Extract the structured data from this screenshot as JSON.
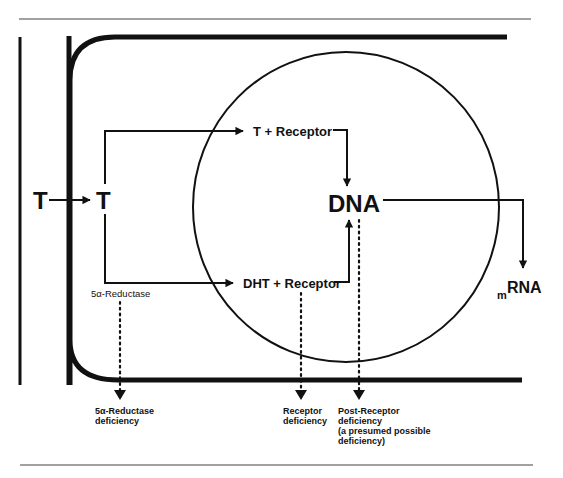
{
  "diagram": {
    "colors": {
      "ink": "#111111",
      "rule": "#444444",
      "background": "#ffffff"
    },
    "nodes": {
      "t_outside": "T",
      "t_inside": "T",
      "t_receptor": "T + Receptor",
      "dht_receptor": "DHT + Receptor",
      "dna": "DNA",
      "mrna_prefix": "m",
      "mrna_main": "RNA"
    },
    "enzyme_label": "5α-Reductase",
    "deficiencies": {
      "reductase": [
        "5α-Reductase",
        "deficiency"
      ],
      "receptor": [
        "Receptor",
        "deficiency"
      ],
      "post_receptor": [
        "Post-Receptor",
        "deficiency",
        "(a presumed possible",
        "deficiency)"
      ]
    },
    "edges": [
      {
        "from": "T (outside)",
        "to": "T (inside)",
        "style": "solid"
      },
      {
        "from": "T (inside)",
        "to": "T + Receptor",
        "style": "solid"
      },
      {
        "from": "T (inside)",
        "to": "DHT + Receptor",
        "style": "solid",
        "label": "5α-Reductase"
      },
      {
        "from": "T + Receptor",
        "to": "DNA",
        "style": "solid"
      },
      {
        "from": "DHT + Receptor",
        "to": "DNA",
        "style": "solid"
      },
      {
        "from": "DNA",
        "to": "mRNA",
        "style": "solid"
      },
      {
        "from": "5α-Reductase",
        "to": "5α-Reductase deficiency",
        "style": "dotted"
      },
      {
        "from": "DHT + Receptor",
        "to": "Receptor deficiency",
        "style": "dotted"
      },
      {
        "from": "DNA",
        "to": "Post-Receptor deficiency",
        "style": "dotted"
      }
    ]
  }
}
